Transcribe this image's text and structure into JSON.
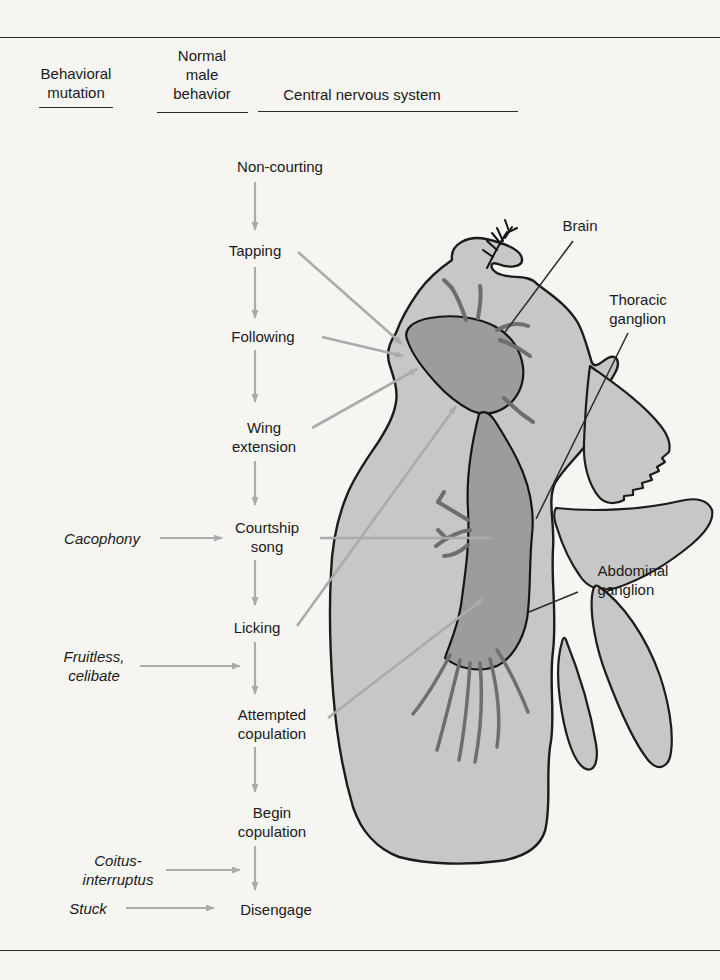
{
  "figure": {
    "colors": {
      "background": "#f6f5f2",
      "body_gray": "#c7c7c7",
      "cns_gray": "#9c9c9c",
      "arrow_gray": "#ababab",
      "outline_black": "#1c1c1c"
    }
  },
  "column_headers": [
    {
      "label": "Behavioral\nmutation"
    },
    {
      "label": "Normal\nmale\nbehavior"
    },
    {
      "label": "Central nervous system"
    }
  ],
  "behavior_sequence": [
    {
      "label": "Non-courting"
    },
    {
      "label": "Tapping"
    },
    {
      "label": "Following"
    },
    {
      "label": "Wing\nextension"
    },
    {
      "label": "Courtship\nsong"
    },
    {
      "label": "Licking"
    },
    {
      "label": "Attempted\ncopulation"
    },
    {
      "label": "Begin\ncopulation"
    },
    {
      "label": "Disengage"
    }
  ],
  "mutations": [
    {
      "label": "Cacophony",
      "points_to": "Courtship song"
    },
    {
      "label": "Fruitless,\ncelibate",
      "points_to": "between Licking and Attempted copulation"
    },
    {
      "label": "Coitus-\ninterruptus",
      "points_to": "between Begin copulation and Disengage"
    },
    {
      "label": "Stuck",
      "points_to": "Disengage"
    }
  ],
  "cns_labels": [
    {
      "label": "Brain"
    },
    {
      "label": "Thoracic\nganglion"
    },
    {
      "label": "Abdominal\nganglion"
    }
  ]
}
